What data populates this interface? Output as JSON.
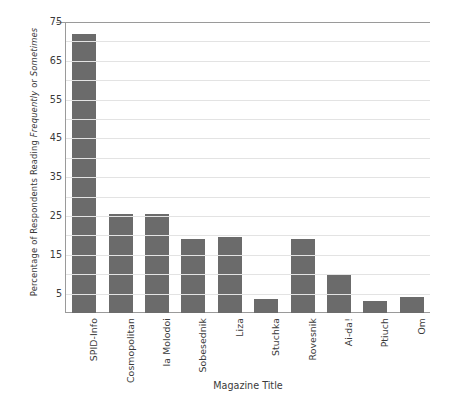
{
  "chart_data": {
    "type": "bar",
    "title": "",
    "xlabel": "Magazine Title",
    "ylabel_parts": [
      {
        "text": "Percentage of Respondents Reading ",
        "style": "normal"
      },
      {
        "text": "Frequently",
        "style": "italic"
      },
      {
        "text": " or ",
        "style": "normal"
      },
      {
        "text": "Sometimes",
        "style": "italic"
      }
    ],
    "ylabel": "Percentage of Respondents Reading Frequently or Sometimes",
    "categories": [
      "SPID-Info",
      "Cosmopolitan",
      "Ia Molodoi",
      "Sobesednik",
      "Liza",
      "Stuchka",
      "Rovesnik",
      "Ai-da!",
      "Ptiuch",
      "Om"
    ],
    "values": [
      72,
      25.5,
      25.5,
      19,
      19.5,
      3.5,
      19,
      10,
      3,
      4
    ],
    "yticks": [
      5,
      15,
      25,
      35,
      45,
      55,
      65,
      75
    ],
    "ylim": [
      0,
      75
    ],
    "grid": true,
    "grid_orientation": "horizontal",
    "legend": "none",
    "bar_color": "#6b6b6b",
    "axis_color": "#9a9a9a",
    "gridline_color": "#e3e3e3",
    "background_color": "#ffffff"
  }
}
